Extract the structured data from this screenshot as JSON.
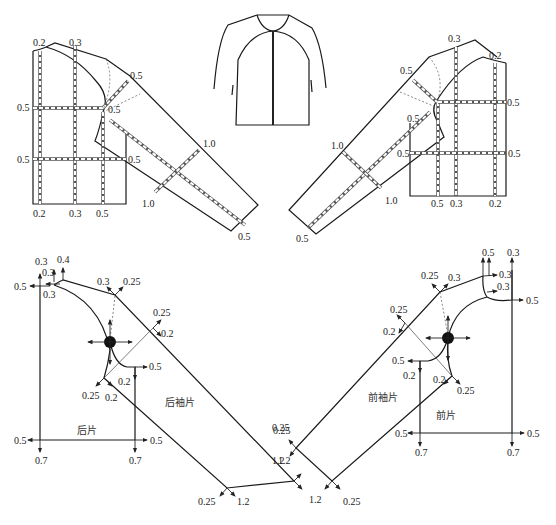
{
  "figure": {
    "type": "garment grading pattern diagram",
    "garment": "raglan sleeve jacket",
    "top_left_pattern": {
      "top_labels": [
        "0.2",
        "0.3"
      ],
      "left_labels": [
        "0.5",
        "0.5"
      ],
      "bottom_labels": [
        "0.2",
        "0.3",
        "0.5"
      ],
      "inner_labels": [
        "0.5",
        "0.5"
      ],
      "sleeve_labels": [
        "0.5",
        "1.0",
        "1.0",
        "0.5"
      ]
    },
    "top_right_pattern": {
      "top_labels": [
        "0.3",
        "0.2"
      ],
      "right_labels": [
        "0.5",
        "0.5"
      ],
      "bottom_labels": [
        "0.5",
        "0.3",
        "0.2"
      ],
      "inner_labels": [
        "0.5",
        "0.5",
        "0.5"
      ],
      "sleeve_labels": [
        "1.0",
        "1.0",
        "0.5"
      ]
    },
    "back_grading": {
      "piece_label": "后片",
      "sleeve_label": "后袖片",
      "labels": {
        "neck_top_a": "0.3",
        "neck_top_b": "0.4",
        "neck_mid": "0.3",
        "neck_left": "0.5",
        "neck_low": "0.3",
        "shoulder_a": "0.3",
        "shoulder_b": "0.25",
        "sleeve_top_a": "0.25",
        "sleeve_top_b": "0.2",
        "underarm_right": "0.5",
        "underarm_down": "0.2",
        "underarm_a": "0.25",
        "underarm_b": "0.2",
        "hem_left": "0.5",
        "hem_right": "0.5",
        "hem_down_left": "0.7",
        "hem_down_right": "0.7",
        "cuff_top_a": "0.25",
        "cuff_top_b": "1.2",
        "cuff_bot_a": "0.25",
        "cuff_bot_b": "1.2"
      }
    },
    "front_grading": {
      "piece_label": "前片",
      "sleeve_label": "前袖片",
      "labels": {
        "neck_top_a": "0.5",
        "neck_top_b": "0.3",
        "neck_mid": "0.3",
        "neck_low": "0.3",
        "neck_right": "0.5",
        "shoulder_a": "0.25",
        "shoulder_b": "0.3",
        "sleeve_top_a": "0.25",
        "sleeve_top_b": "0.2",
        "underarm_left": "0.5",
        "underarm_down": "0.2",
        "underarm_a": "0.2",
        "underarm_b": "0.25",
        "hem_left": "0.5",
        "hem_right": "0.5",
        "hem_down_left": "0.7",
        "hem_down_right": "0.7",
        "cuff_top_a": "0.25",
        "cuff_top_b": "1.2",
        "cuff_bot_a": "1.2",
        "cuff_bot_b": "0.25"
      }
    }
  }
}
